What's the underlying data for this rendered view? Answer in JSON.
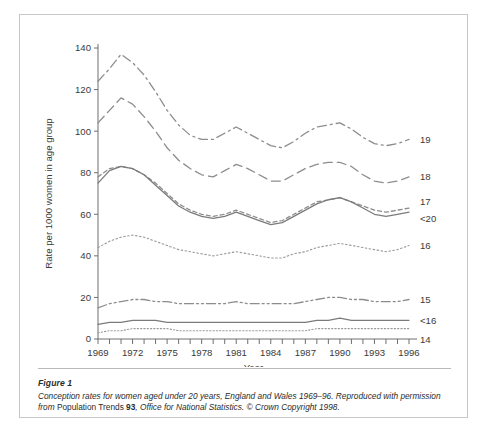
{
  "figure": {
    "caption_title": "Figure 1",
    "caption_line1_a": "Conception rates for women aged under 20 years, England and Wales 1969–96. Reproduced with",
    "caption_line2_a": "permission from ",
    "caption_source_name": "Population Trends",
    "caption_source_num": "93",
    "caption_line2_b": ", Office for National Statistics. © Crown Copyright 1998."
  },
  "chart_data": {
    "type": "line",
    "title": "",
    "xlabel": "Year",
    "ylabel": "Rate per 1000 women in age group",
    "xlim": [
      1969,
      1996
    ],
    "ylim": [
      0,
      140
    ],
    "ytick_step": 20,
    "yticks": [
      0,
      20,
      40,
      60,
      80,
      100,
      120,
      140
    ],
    "xticks_all": [
      1969,
      1970,
      1971,
      1972,
      1973,
      1974,
      1975,
      1976,
      1977,
      1978,
      1979,
      1980,
      1981,
      1982,
      1983,
      1984,
      1985,
      1986,
      1987,
      1988,
      1989,
      1990,
      1991,
      1992,
      1993,
      1994,
      1995,
      1996
    ],
    "xtick_labels": [
      1969,
      1972,
      1975,
      1978,
      1981,
      1984,
      1987,
      1990,
      1993,
      1996
    ],
    "grid": false,
    "legend_position": "right-of-line-ends",
    "x": [
      1969,
      1970,
      1971,
      1972,
      1973,
      1974,
      1975,
      1976,
      1977,
      1978,
      1979,
      1980,
      1981,
      1982,
      1983,
      1984,
      1985,
      1986,
      1987,
      1988,
      1989,
      1990,
      1991,
      1992,
      1993,
      1994,
      1995,
      1996
    ],
    "series": [
      {
        "name": "19",
        "label": "19",
        "dash": "dash-dot",
        "color": "#8d8d8d",
        "values": [
          124,
          130,
          137,
          133,
          127,
          119,
          110,
          103,
          98,
          96,
          96,
          99,
          102,
          99,
          96,
          93,
          92,
          95,
          99,
          102,
          103,
          104,
          101,
          97,
          94,
          93,
          94,
          96
        ]
      },
      {
        "name": "18",
        "label": "18",
        "dash": "dash-long",
        "color": "#8d8d8d",
        "values": [
          104,
          110,
          116,
          113,
          107,
          100,
          92,
          86,
          82,
          79,
          78,
          81,
          84,
          82,
          79,
          76,
          76,
          79,
          82,
          84,
          85,
          85,
          83,
          79,
          76,
          75,
          76,
          78
        ]
      },
      {
        "name": "17",
        "label": "17",
        "dash": "dash-short",
        "color": "#8d8d8d",
        "values": [
          78,
          82,
          83,
          82,
          79,
          75,
          70,
          65,
          62,
          60,
          59,
          60,
          62,
          60,
          58,
          56,
          57,
          60,
          63,
          66,
          67,
          68,
          66,
          64,
          62,
          61,
          62,
          63
        ]
      },
      {
        "name": "<20",
        "label": "<20",
        "dash": "solid",
        "color": "#7b7b7b",
        "values": [
          75,
          81,
          83,
          82,
          79,
          74,
          69,
          64,
          61,
          59,
          58,
          59,
          61,
          59,
          57,
          55,
          56,
          59,
          62,
          65,
          67,
          68,
          66,
          63,
          60,
          59,
          60,
          61
        ]
      },
      {
        "name": "16",
        "label": "16",
        "dash": "dotted",
        "color": "#9a9a9a",
        "values": [
          44,
          47,
          49,
          50,
          49,
          47,
          45,
          43,
          42,
          41,
          40,
          41,
          42,
          41,
          40,
          39,
          39,
          41,
          42,
          44,
          45,
          46,
          45,
          44,
          43,
          42,
          43,
          45
        ]
      },
      {
        "name": "15",
        "label": "15",
        "dash": "dash-dot-dot",
        "color": "#8d8d8d",
        "values": [
          15,
          17,
          18,
          19,
          19,
          18,
          18,
          17,
          17,
          17,
          17,
          17,
          18,
          17,
          17,
          17,
          17,
          17,
          18,
          19,
          20,
          20,
          19,
          19,
          18,
          18,
          18,
          19
        ]
      },
      {
        "name": "<16",
        "label": "<16",
        "dash": "solid",
        "color": "#7b7b7b",
        "values": [
          7,
          8,
          8,
          9,
          9,
          9,
          8,
          8,
          8,
          8,
          8,
          8,
          8,
          8,
          8,
          8,
          8,
          8,
          8,
          9,
          9,
          10,
          9,
          9,
          9,
          9,
          9,
          9
        ]
      },
      {
        "name": "14",
        "label": "14",
        "dash": "fine-dot",
        "color": "#9a9a9a",
        "values": [
          3,
          4,
          4,
          5,
          5,
          5,
          5,
          4,
          4,
          4,
          4,
          4,
          4,
          4,
          4,
          4,
          4,
          4,
          4,
          5,
          5,
          5,
          5,
          5,
          5,
          5,
          5,
          5
        ]
      }
    ]
  }
}
